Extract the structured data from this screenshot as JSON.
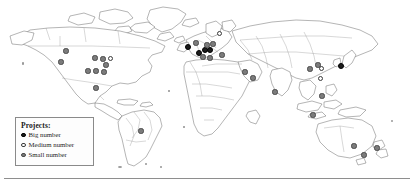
{
  "figure": {
    "type": "world-map-distribution",
    "title_visible": false,
    "background_color": "#ffffff",
    "map_line_color": "#5a5a5a",
    "border_line_color": "#8d8d8d"
  },
  "legend": {
    "title": "Projects:",
    "box_border_color": "#8a8a8a",
    "items": [
      {
        "label": "Big number",
        "marker": "filled-black-circle",
        "color": "#1c1c1c",
        "category": "big"
      },
      {
        "label": "Medium number",
        "marker": "hollow-circle",
        "color": "#ffffff",
        "category": "medium"
      },
      {
        "label": "Small number",
        "marker": "filled-gray-circle",
        "color": "#7b7b7b",
        "category": "small"
      }
    ]
  },
  "chart_data": {
    "type": "scatter",
    "title": "",
    "xlabel": "",
    "ylabel": "",
    "projection": "equirectangular-world",
    "categories": [
      "Big number",
      "Medium number",
      "Small number"
    ],
    "points": [
      {
        "x": 66,
        "y": 51,
        "category": "small"
      },
      {
        "x": 61,
        "y": 62,
        "category": "small"
      },
      {
        "x": 95,
        "y": 58,
        "category": "small"
      },
      {
        "x": 103,
        "y": 59,
        "category": "small"
      },
      {
        "x": 110,
        "y": 58,
        "category": "medium"
      },
      {
        "x": 106,
        "y": 65,
        "category": "small"
      },
      {
        "x": 88,
        "y": 71,
        "category": "small"
      },
      {
        "x": 96,
        "y": 71,
        "category": "small"
      },
      {
        "x": 104,
        "y": 72,
        "category": "small"
      },
      {
        "x": 96,
        "y": 88,
        "category": "small"
      },
      {
        "x": 141,
        "y": 131,
        "category": "small"
      },
      {
        "x": 188,
        "y": 47,
        "category": "big"
      },
      {
        "x": 196,
        "y": 43,
        "category": "small"
      },
      {
        "x": 199,
        "y": 53,
        "category": "big"
      },
      {
        "x": 205,
        "y": 50,
        "category": "big"
      },
      {
        "x": 210,
        "y": 50,
        "category": "big"
      },
      {
        "x": 207,
        "y": 45,
        "category": "small"
      },
      {
        "x": 213,
        "y": 44,
        "category": "small"
      },
      {
        "x": 219,
        "y": 33,
        "category": "medium"
      },
      {
        "x": 203,
        "y": 57,
        "category": "small"
      },
      {
        "x": 210,
        "y": 58,
        "category": "small"
      },
      {
        "x": 222,
        "y": 55,
        "category": "small"
      },
      {
        "x": 245,
        "y": 72,
        "category": "small"
      },
      {
        "x": 253,
        "y": 78,
        "category": "small"
      },
      {
        "x": 275,
        "y": 92,
        "category": "small"
      },
      {
        "x": 310,
        "y": 69,
        "category": "small"
      },
      {
        "x": 318,
        "y": 65,
        "category": "small"
      },
      {
        "x": 321,
        "y": 68,
        "category": "medium"
      },
      {
        "x": 320,
        "y": 78,
        "category": "medium"
      },
      {
        "x": 341,
        "y": 66,
        "category": "big"
      },
      {
        "x": 322,
        "y": 96,
        "category": "small"
      },
      {
        "x": 313,
        "y": 115,
        "category": "small"
      },
      {
        "x": 354,
        "y": 146,
        "category": "small"
      },
      {
        "x": 364,
        "y": 155,
        "category": "small"
      },
      {
        "x": 377,
        "y": 148,
        "category": "small"
      }
    ],
    "counts": {
      "big": 6,
      "medium": 4,
      "small": 25,
      "total": 35
    },
    "grid": false,
    "legend_position": "bottom-left"
  }
}
